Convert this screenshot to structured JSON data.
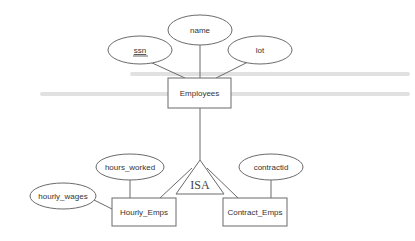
{
  "diagram": {
    "type": "ER diagram",
    "entities": [
      {
        "id": "employees",
        "label": "Employees"
      },
      {
        "id": "hourly",
        "label": "Hourly_Emps"
      },
      {
        "id": "contract",
        "label": "Contract_Emps"
      }
    ],
    "attributes": [
      {
        "id": "ssn",
        "label": "ssn",
        "key": true,
        "entity": "employees"
      },
      {
        "id": "name",
        "label": "name",
        "key": false,
        "entity": "employees"
      },
      {
        "id": "lot",
        "label": "lot",
        "key": false,
        "entity": "employees"
      },
      {
        "id": "hours_worked",
        "label": "hours_worked",
        "key": false,
        "entity": "hourly"
      },
      {
        "id": "hourly_wages",
        "label": "hourly_wages",
        "key": false,
        "entity": "hourly"
      },
      {
        "id": "contractid",
        "label": "contractid",
        "key": false,
        "entity": "contract"
      }
    ],
    "isa": {
      "label": "ISA",
      "parent": "employees",
      "children": [
        "hourly",
        "contract"
      ]
    },
    "colors": {
      "stroke": "#6a6a6a",
      "text": "#333333",
      "background": "#ffffff"
    }
  }
}
